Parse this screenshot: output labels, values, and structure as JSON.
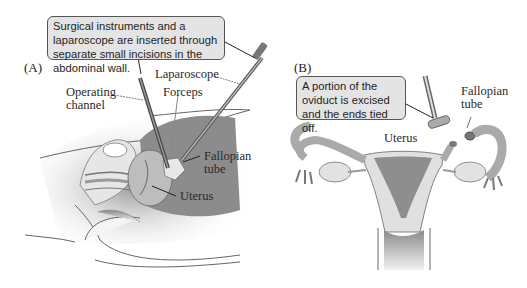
{
  "figure": {
    "panel_a": {
      "label": "(A)",
      "callout": "Surgical instruments and a laparoscope are inserted through separate small incisions in the abdominal wall.",
      "labels": {
        "laparoscope": "Laparoscope",
        "operating_channel_line1": "Operating",
        "operating_channel_line2": "channel",
        "forceps": "Forceps",
        "fallopian_line1": "Fallopian",
        "fallopian_line2": "tube",
        "uterus": "Uterus"
      }
    },
    "panel_b": {
      "label": "(B)",
      "callout": "A portion of the oviduct is excised and the ends tied off.",
      "labels": {
        "fallopian_line1": "Fallopian",
        "fallopian_line2": "tube",
        "uterus": "Uterus"
      }
    },
    "colors": {
      "callout_fill": "#e4e4e4",
      "tissue_dark": "#8a8a8a",
      "tissue_mid": "#b5b5b5",
      "tissue_light": "#dcdcdc",
      "outline": "#555555"
    }
  }
}
